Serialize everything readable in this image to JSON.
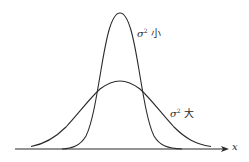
{
  "figure": {
    "stroke_color": "#2b2b2b",
    "background": "#ffffff",
    "axis": {
      "label": "x",
      "y": 149,
      "x_start": 15,
      "x_end": 229
    },
    "curves": [
      {
        "name": "small-variance-curve",
        "label_symbol": "σ",
        "label_exponent": "2",
        "label_text": "小",
        "peak_x": 120,
        "peak_y": 13
      },
      {
        "name": "large-variance-curve",
        "label_symbol": "σ",
        "label_exponent": "2",
        "label_text": "大",
        "peak_x": 120,
        "peak_y": 81
      }
    ]
  }
}
